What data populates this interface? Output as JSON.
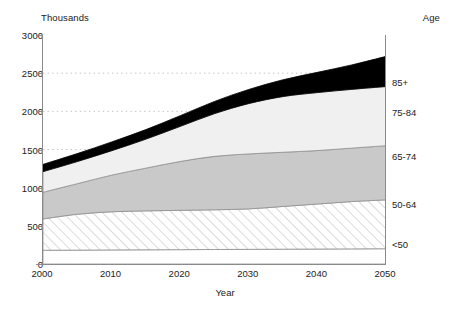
{
  "chart_data": {
    "type": "area",
    "stacked": true,
    "title": "",
    "subtitle": "",
    "xlabel": "Year",
    "ylabel": "Thousands",
    "y_unit_label": "Thousands",
    "right_axis_label": "Age",
    "grid": "horizontal-dotted",
    "legend_position": "right-inline",
    "xlim": [
      2000,
      2050
    ],
    "ylim": [
      0,
      3000
    ],
    "y_ticks": [
      0,
      500,
      1000,
      1500,
      2000,
      2500,
      3000
    ],
    "x_ticks": [
      2000,
      2010,
      2020,
      2030,
      2040,
      2050
    ],
    "x": [
      2000,
      2005,
      2010,
      2015,
      2020,
      2025,
      2030,
      2035,
      2040,
      2045,
      2050
    ],
    "series": [
      {
        "name": "<50",
        "label": "<50",
        "fill": "#ffffff",
        "pattern": "solid",
        "values": [
          180,
          182,
          184,
          186,
          188,
          190,
          192,
          194,
          196,
          198,
          200
        ]
      },
      {
        "name": "50-64",
        "label": "50-64",
        "fill": "#fafafa",
        "pattern": "diagonal-hatch",
        "values": [
          410,
          470,
          500,
          510,
          515,
          520,
          530,
          560,
          590,
          620,
          640
        ]
      },
      {
        "name": "65-74",
        "label": "65-74",
        "fill": "#c9c9c9",
        "pattern": "solid",
        "values": [
          350,
          400,
          480,
          560,
          640,
          700,
          720,
          710,
          700,
          700,
          710
        ]
      },
      {
        "name": "75-84",
        "label": "75-84",
        "fill": "#f0f0f0",
        "pattern": "solid",
        "values": [
          270,
          290,
          320,
          380,
          460,
          560,
          660,
          730,
          760,
          770,
          775
        ]
      },
      {
        "name": "85+",
        "label": "85+",
        "fill": "#000000",
        "pattern": "solid",
        "values": [
          95,
          105,
          115,
          125,
          140,
          160,
          185,
          220,
          265,
          320,
          395
        ]
      }
    ],
    "age_band_labels": [
      {
        "label": "85+",
        "anchor_value": 2380
      },
      {
        "label": "75-84",
        "anchor_value": 1990
      },
      {
        "label": "65-74",
        "anchor_value": 1420
      },
      {
        "label": "50-64",
        "anchor_value": 790
      },
      {
        "label": "<50",
        "anchor_value": 260
      }
    ]
  }
}
